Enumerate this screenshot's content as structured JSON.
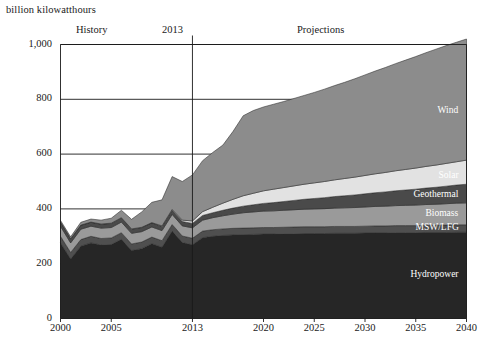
{
  "chart_data": {
    "type": "area",
    "title": "",
    "ylabel": "billion kilowatthours",
    "xlabel": "",
    "ylim": [
      0,
      1000
    ],
    "xlim": [
      2000,
      2040
    ],
    "grid": true,
    "legend_position": "inline-right",
    "yticks": [
      "0",
      "200",
      "400",
      "600",
      "800",
      "1,000"
    ],
    "ytick_values": [
      0,
      200,
      400,
      600,
      800,
      1000
    ],
    "xticks": [
      "2000",
      "2005",
      "2013",
      "2020",
      "2025",
      "2030",
      "2035",
      "2040"
    ],
    "xtick_values": [
      2000,
      2005,
      2013,
      2020,
      2025,
      2030,
      2035,
      2040
    ],
    "annotations": {
      "history": "History",
      "divider": "2013",
      "projections": "Projections",
      "divider_year": 2013
    },
    "x": [
      2000,
      2001,
      2002,
      2003,
      2004,
      2005,
      2006,
      2007,
      2008,
      2009,
      2010,
      2011,
      2012,
      2013,
      2014,
      2015,
      2016,
      2017,
      2018,
      2019,
      2020,
      2021,
      2022,
      2023,
      2024,
      2025,
      2026,
      2027,
      2028,
      2029,
      2030,
      2031,
      2032,
      2033,
      2034,
      2035,
      2036,
      2037,
      2038,
      2039,
      2040
    ],
    "series": [
      {
        "name": "Hydropower",
        "color": "#262626",
        "values": [
          276,
          217,
          264,
          276,
          268,
          270,
          289,
          248,
          255,
          273,
          260,
          319,
          277,
          269,
          295,
          300,
          303,
          305,
          306,
          307,
          308,
          308,
          309,
          309,
          310,
          310,
          310,
          311,
          311,
          311,
          312,
          312,
          312,
          313,
          313,
          313,
          314,
          314,
          314,
          315,
          315
        ]
      },
      {
        "name": "MSW/LFG",
        "color": "#4f4f4f",
        "values": [
          24,
          24,
          24,
          24,
          24,
          24,
          24,
          24,
          24,
          24,
          24,
          24,
          24,
          24,
          24,
          24,
          24,
          24,
          24,
          24,
          24,
          24,
          24,
          25,
          25,
          25,
          25,
          25,
          25,
          25,
          25,
          26,
          26,
          26,
          26,
          26,
          26,
          26,
          27,
          27,
          27
        ]
      },
      {
        "name": "Biomass",
        "color": "#9a9a9a",
        "values": [
          37,
          35,
          38,
          37,
          38,
          38,
          39,
          39,
          38,
          37,
          37,
          37,
          37,
          38,
          40,
          44,
          48,
          52,
          56,
          58,
          60,
          61,
          62,
          63,
          64,
          65,
          66,
          67,
          68,
          69,
          70,
          71,
          72,
          73,
          74,
          75,
          76,
          77,
          78,
          79,
          80
        ]
      },
      {
        "name": "Geothermal",
        "color": "#4a4a4a",
        "values": [
          14,
          14,
          14,
          14,
          14,
          15,
          15,
          15,
          15,
          15,
          15,
          15,
          16,
          16,
          17,
          18,
          20,
          22,
          24,
          26,
          28,
          30,
          32,
          34,
          36,
          38,
          40,
          42,
          44,
          46,
          48,
          50,
          52,
          54,
          56,
          58,
          60,
          62,
          64,
          66,
          68
        ]
      },
      {
        "name": "Solar",
        "color": "#e2e2e2",
        "values": [
          1,
          1,
          1,
          1,
          1,
          1,
          1,
          1,
          1,
          1,
          2,
          3,
          5,
          9,
          14,
          20,
          26,
          32,
          38,
          42,
          46,
          49,
          51,
          53,
          55,
          57,
          59,
          61,
          63,
          65,
          67,
          69,
          71,
          73,
          75,
          77,
          79,
          81,
          83,
          85,
          88
        ]
      },
      {
        "name": "Wind",
        "color": "#8c8c8c",
        "values": [
          6,
          7,
          10,
          11,
          14,
          18,
          27,
          35,
          56,
          74,
          95,
          120,
          141,
          168,
          186,
          200,
          212,
          248,
          292,
          302,
          306,
          310,
          314,
          319,
          324,
          330,
          337,
          344,
          351,
          359,
          367,
          375,
          383,
          391,
          399,
          407,
          415,
          423,
          430,
          436,
          442
        ]
      }
    ]
  },
  "labels": {
    "wind": "Wind",
    "solar": "Solar",
    "geothermal": "Geothermal",
    "biomass": "Biomass",
    "msw": "MSW/LFG",
    "hydropower": "Hydropower"
  },
  "colors": {
    "axis": "#1a1a1a",
    "grid": "#1a1a1a",
    "background": "#ffffff"
  }
}
